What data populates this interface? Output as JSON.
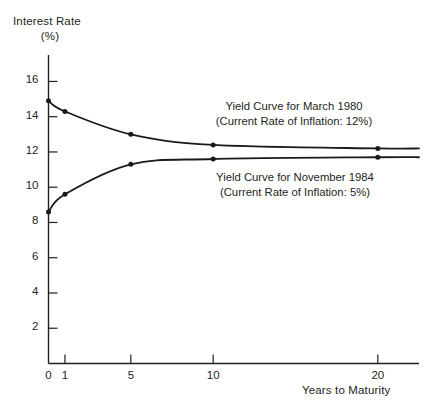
{
  "chart_data": {
    "type": "line",
    "title": "",
    "ylabel": "Interest Rate",
    "yunit": "(%)",
    "xlabel": "Years to Maturity",
    "xlim": [
      0,
      22.5
    ],
    "ylim": [
      0,
      17.5
    ],
    "grid": false,
    "legend_position": "inline-annotations",
    "xticks": [
      0,
      1,
      5,
      10,
      20
    ],
    "xtick_labels": [
      "0",
      "1",
      "5",
      "10",
      "20"
    ],
    "yticks": [
      2,
      4,
      6,
      8,
      10,
      12,
      14,
      16
    ],
    "ytick_labels": [
      "2",
      "4",
      "6",
      "8",
      "10",
      "12",
      "14",
      "16"
    ],
    "series": [
      {
        "name": "Yield Curve for March 1980",
        "annotation_line1": "Yield Curve for March 1980",
        "annotation_line2": "(Current Rate of Inflation: 12%)",
        "inflation_rate": "12%",
        "x": [
          0,
          1,
          5,
          10,
          20,
          22.5
        ],
        "values": [
          14.9,
          14.3,
          13.0,
          12.4,
          12.2,
          12.2
        ],
        "marker_x": [
          0,
          1,
          5,
          10,
          20
        ],
        "marker_values": [
          14.9,
          14.3,
          13.0,
          12.4,
          12.2
        ],
        "color": "#1a1a1a"
      },
      {
        "name": "Yield Curve for November 1984",
        "annotation_line1": "Yield Curve for November 1984",
        "annotation_line2": "(Current Rate of Inflation: 5%)",
        "inflation_rate": "5%",
        "x": [
          0,
          1,
          5,
          10,
          20,
          22.5
        ],
        "values": [
          8.6,
          9.6,
          11.3,
          11.6,
          11.7,
          11.7
        ],
        "marker_x": [
          0,
          1,
          5,
          10,
          20
        ],
        "marker_values": [
          8.6,
          9.6,
          11.3,
          11.6,
          11.7
        ],
        "color": "#1a1a1a"
      }
    ]
  }
}
